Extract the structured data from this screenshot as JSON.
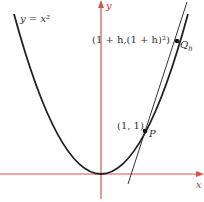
{
  "diagram": {
    "curve_label": "y = x²",
    "curve_label_y": "y",
    "curve_label_eq": " = ",
    "curve_label_x2": "x²",
    "axis_x_label": "x",
    "axis_y_label": "y",
    "point_p": {
      "coords": "(1, 1)",
      "name": "P"
    },
    "point_q": {
      "coords": "(1 + h,(1 + h)²)",
      "name": "Q",
      "subscript": "h"
    },
    "colors": {
      "axes": "#d9534f",
      "curve": "#222222",
      "line": "#333333"
    }
  }
}
